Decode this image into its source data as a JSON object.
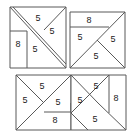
{
  "figure": {
    "background_color": "#ffffff",
    "line_color": "#595959",
    "label_color": "#1a1a1a",
    "squares": [
      {
        "id": "top-left",
        "name": "square-top-left",
        "x": 10,
        "y": 7,
        "size": 56,
        "labels": [
          {
            "text": "5",
            "x": 38,
            "y": 19
          },
          {
            "text": "5",
            "x": 52,
            "y": 32
          },
          {
            "text": "8",
            "x": 18,
            "y": 45
          },
          {
            "text": "5",
            "x": 35,
            "y": 50
          }
        ]
      },
      {
        "id": "top-right",
        "name": "square-top-right",
        "x": 70,
        "y": 12,
        "size": 55,
        "labels": [
          {
            "text": "8",
            "x": 89,
            "y": 21
          },
          {
            "text": "5",
            "x": 80,
            "y": 38
          },
          {
            "text": "5",
            "x": 113,
            "y": 40
          },
          {
            "text": "5",
            "x": 96,
            "y": 57
          }
        ]
      },
      {
        "id": "bottom-left",
        "name": "square-bottom-left",
        "x": 16,
        "y": 75,
        "size": 55,
        "labels": [
          {
            "text": "5",
            "x": 42,
            "y": 87
          },
          {
            "text": "5",
            "x": 25,
            "y": 101
          },
          {
            "text": "5",
            "x": 58,
            "y": 103
          },
          {
            "text": "8",
            "x": 55,
            "y": 121
          }
        ]
      },
      {
        "id": "bottom-right",
        "name": "square-bottom-right",
        "x": 71,
        "y": 75,
        "size": 55,
        "labels": [
          {
            "text": "5",
            "x": 96,
            "y": 87
          },
          {
            "text": "5",
            "x": 80,
            "y": 101
          },
          {
            "text": "8",
            "x": 116,
            "y": 99
          },
          {
            "text": "5",
            "x": 95,
            "y": 120
          }
        ]
      }
    ]
  }
}
